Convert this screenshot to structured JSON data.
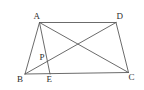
{
  "figure": {
    "type": "geometry-diagram",
    "background_color": "#ffffff",
    "line_color": "#5a5a5a",
    "label_color": "#2b2b2b",
    "width": 144,
    "height": 90,
    "points": [
      {
        "id": "A",
        "label": "A",
        "x": 39.5,
        "y": 22.5,
        "label_x": 33.5,
        "label_y": 11.5
      },
      {
        "id": "D",
        "label": "D",
        "x": 116.0,
        "y": 22.5,
        "label_x": 116.5,
        "label_y": 11.5
      },
      {
        "id": "B",
        "label": "B",
        "x": 25.0,
        "y": 74.0,
        "label_x": 17.0,
        "label_y": 74.5
      },
      {
        "id": "C",
        "label": "C",
        "x": 128.5,
        "y": 72.5,
        "label_x": 128.5,
        "label_y": 73.0
      },
      {
        "id": "E",
        "label": "E",
        "x": 50.0,
        "y": 74.0,
        "label_x": 46.5,
        "label_y": 75.0
      },
      {
        "id": "P",
        "label": "P",
        "x": 46.0,
        "y": 62.0,
        "label_x": 39.5,
        "label_y": 52.5
      }
    ],
    "segments": [
      {
        "id": "AD",
        "from": "A",
        "to": "D",
        "name": "segment-ad"
      },
      {
        "id": "AB",
        "from": "A",
        "to": "B",
        "name": "segment-ab"
      },
      {
        "id": "AE",
        "from": "A",
        "to": "E",
        "name": "segment-ae"
      },
      {
        "id": "AC",
        "from": "A",
        "to": "C",
        "name": "segment-ac-diagonal"
      },
      {
        "id": "BD",
        "from": "B",
        "to": "D",
        "name": "segment-bd-diagonal"
      },
      {
        "id": "BC",
        "from": "B",
        "to": "C",
        "name": "segment-bc"
      },
      {
        "id": "DC",
        "from": "D",
        "to": "C",
        "name": "segment-dc"
      }
    ]
  }
}
